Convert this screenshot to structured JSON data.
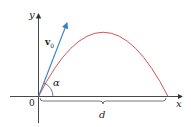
{
  "diagram": {
    "labels": {
      "y_axis": "y",
      "x_axis": "x",
      "origin": "0",
      "velocity": "v",
      "velocity_subscript": "0",
      "angle": "α",
      "distance": "d"
    },
    "colors": {
      "axes": "#333333",
      "velocity_vector": "#3a7fc4",
      "trajectory": "#d9534f",
      "brace": "#555555",
      "background": "#ffffff"
    }
  }
}
